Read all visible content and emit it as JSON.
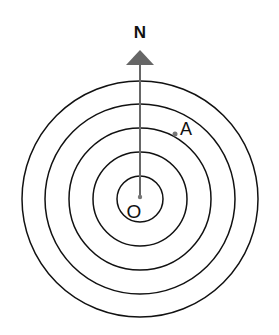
{
  "diagram": {
    "labels": {
      "north": "N",
      "origin": "O",
      "point_a": "A"
    },
    "center": {
      "x": 140,
      "y": 199
    },
    "circle_radii": [
      23,
      47,
      71,
      95,
      118
    ],
    "circle_count": 5,
    "arrow": {
      "direction": "north",
      "color": "#666666"
    },
    "point_a": {
      "ring_index": 3,
      "bearing_deg": 45
    },
    "colors": {
      "circle_stroke": "#111111",
      "arrow": "#666666",
      "point": "#777777"
    }
  }
}
